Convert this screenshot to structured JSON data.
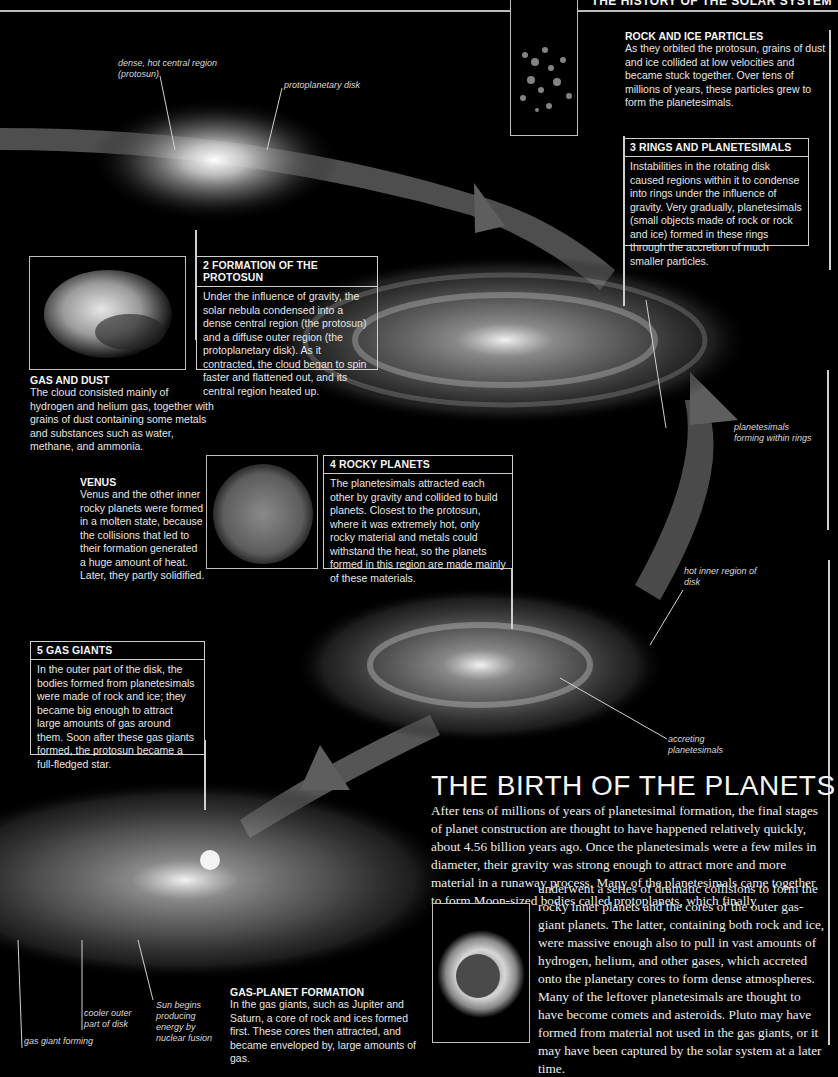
{
  "header": {
    "title": "THE HISTORY OF THE SOLAR SYSTEM"
  },
  "colors": {
    "background": "#000000",
    "rules": "#cfcfcf",
    "arrow": "#5a5a5a",
    "text": "#e8e8e8"
  },
  "nebula_labels": {
    "protosun": "dense, hot central region (protosun)",
    "disk": "protoplanetary disk"
  },
  "rock_ice": {
    "title": "ROCK AND ICE PARTICLES",
    "body": "As they orbited the protosun, grains of dust and ice collided at low velocities and became stuck together. Over tens of millions of years, these particles grew to form the planetesimals."
  },
  "step3": {
    "title": "3 RINGS AND PLANETESIMALS",
    "body": "Instabilities in the rotating disk caused regions within it to condense into rings under the influence of gravity. Very gradually, planetesimals (small objects made of rock or rock and ice) formed in these rings through the accretion of much smaller particles."
  },
  "step2": {
    "title": "2 FORMATION OF THE PROTOSUN",
    "body": "Under the influence of gravity, the solar nebula condensed into a dense central region (the protosun) and a diffuse outer region (the protoplanetary disk). As it contracted, the cloud began to spin faster and flattened out, and its central region heated up."
  },
  "gas_dust": {
    "title": "GAS AND DUST",
    "body": "The cloud consisted mainly of hydrogen and helium gas, together with grains of dust containing some metals and substances such as water, methane, and ammonia."
  },
  "rings_label": "planetesimals forming within rings",
  "venus": {
    "title": "VENUS",
    "body": "Venus and the other inner rocky planets were formed in a molten state, because the collisions that led to their formation generated a huge amount of heat. Later, they partly solidified."
  },
  "step4": {
    "title": "4 ROCKY PLANETS",
    "body": "The planetesimals attracted each other by gravity and collided to build planets. Closest to the protosun, where it was extremely hot, only rocky material and metals could withstand the heat, so the planets formed in this region are made mainly of these materials."
  },
  "inner_disk_label": "hot inner region of disk",
  "accreting_label": "accreting planetesimals",
  "step5": {
    "title": "5 GAS GIANTS",
    "body": "In the outer part of the disk, the bodies formed from planetesimals were made of rock and ice; they became big enough to attract large amounts of gas around them. Soon after these gas giants formed, the protosun became a full-fledged star."
  },
  "birth": {
    "title": "THE BIRTH OF THE PLANETS",
    "para_top": "After tens of millions of years of planetesimal formation, the final stages of planet construction are thought to have happened relatively quickly, about 4.56 billion years ago. Once the planetesimals were a few miles in diameter, their gravity was strong enough to attract more and more material in a runaway process. Many of the planetesimals came together to form Moon-sized bodies called protoplanets, which finally",
    "para_bottom": "underwent a series of dramatic collisions to form the rocky inner planets and the cores of the outer gas-giant planets. The latter, containing both rock and ice, were massive enough also to pull in vast amounts of hydrogen, helium, and other gases, which accreted onto the planetary cores to form dense atmospheres. Many of the leftover planetesimals are thought to have become comets and asteroids. Pluto may have formed from material not used in the gas giants, or it may have been captured by the solar system at a later time."
  },
  "bottom_labels": {
    "gas_giant": "gas giant forming",
    "cooler": "cooler outer part of disk",
    "sun": "Sun begins producing energy by nuclear fusion"
  },
  "gas_planet": {
    "title": "GAS-PLANET FORMATION",
    "body": "In the gas giants, such as Jupiter and Saturn, a core of rock and ices formed first. These cores then attracted, and became enveloped by, large amounts of gas."
  }
}
